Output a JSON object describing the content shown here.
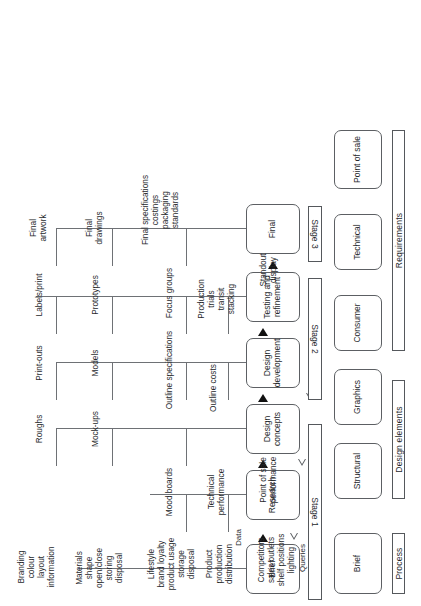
{
  "diagram": {
    "orientation": "landscape artwork rotated 90 degrees on portrait page",
    "row_headers": [
      {
        "id": "process",
        "label": "Process"
      },
      {
        "id": "design-elements",
        "label": "Design elements"
      },
      {
        "id": "requirements",
        "label": "Requirements"
      }
    ],
    "stages": [
      {
        "id": "stage-1",
        "label": "Stage 1"
      },
      {
        "id": "stage-2",
        "label": "Stage 2"
      },
      {
        "id": "stage-3",
        "label": "Stage 3"
      }
    ],
    "categories": {
      "design_elements": [
        {
          "id": "structural",
          "label": "Structural"
        },
        {
          "id": "graphics",
          "label": "Graphics"
        }
      ],
      "requirements": [
        {
          "id": "consumer",
          "label": "Consumer"
        },
        {
          "id": "technical",
          "label": "Technical"
        },
        {
          "id": "point-of-sale",
          "label": "Point of sale"
        }
      ]
    },
    "process_steps": [
      {
        "id": "brief",
        "label": "Brief"
      },
      {
        "id": "research",
        "label": "Research"
      },
      {
        "id": "design-concepts",
        "label": "Design\nconcepts"
      },
      {
        "id": "design-development",
        "label": "Design\ndevelopment"
      },
      {
        "id": "testing-and-refinement",
        "label": "Testing and\nrefinement"
      },
      {
        "id": "final",
        "label": "Final"
      }
    ],
    "flow_markers": [
      {
        "id": "data",
        "label": "Data",
        "style": "solid"
      },
      {
        "id": "queries",
        "label": "Queries",
        "style": "open"
      }
    ],
    "structural_column": [
      {
        "id": "structural-brief",
        "label": "Materials\nshape\nopen/close\nstoring\ndisposal"
      },
      {
        "id": "structural-concepts",
        "label": "Mock-ups"
      },
      {
        "id": "structural-development",
        "label": "Models"
      },
      {
        "id": "structural-testing",
        "label": "Prototypes"
      },
      {
        "id": "structural-final",
        "label": "Final\ndrawings"
      }
    ],
    "graphics_column": [
      {
        "id": "graphics-brief",
        "label": "Branding\ncolour\nlayout\ninformation"
      },
      {
        "id": "graphics-concepts",
        "label": "Roughs"
      },
      {
        "id": "graphics-development",
        "label": "Print-outs"
      },
      {
        "id": "graphics-testing",
        "label": "Labels/print"
      },
      {
        "id": "graphics-final",
        "label": "Final\nartwork"
      }
    ],
    "consumer_column": [
      {
        "id": "consumer-brief",
        "label": "Lifestyle\nbrand loyalty\nproduct usage\nstorage\ndisposal"
      },
      {
        "id": "consumer-concepts",
        "label": "Mood boards"
      },
      {
        "id": "consumer-development",
        "label": "Outline specifications"
      },
      {
        "id": "consumer-testing",
        "label": "Focus groups"
      },
      {
        "id": "consumer-final",
        "label": "Final specifications\ncostings\npackaging\nstandards"
      }
    ],
    "technical_column": [
      {
        "id": "technical-brief",
        "label": "Product\nproduction\ndistribution"
      },
      {
        "id": "technical-concepts",
        "label": "Technical\nperformance"
      },
      {
        "id": "technical-development",
        "label": "Outline costs"
      },
      {
        "id": "technical-testing",
        "label": "Production\ntrials\ntransit\nstacking"
      }
    ],
    "point_of_sale_column": [
      {
        "id": "pos-brief",
        "label": "Competitors\nsales outlets\nshelf positions\nlighting"
      },
      {
        "id": "pos-concepts",
        "label": "Point of sale\nperformance"
      },
      {
        "id": "pos-testing",
        "label": "Standout\ndisplay"
      }
    ]
  }
}
